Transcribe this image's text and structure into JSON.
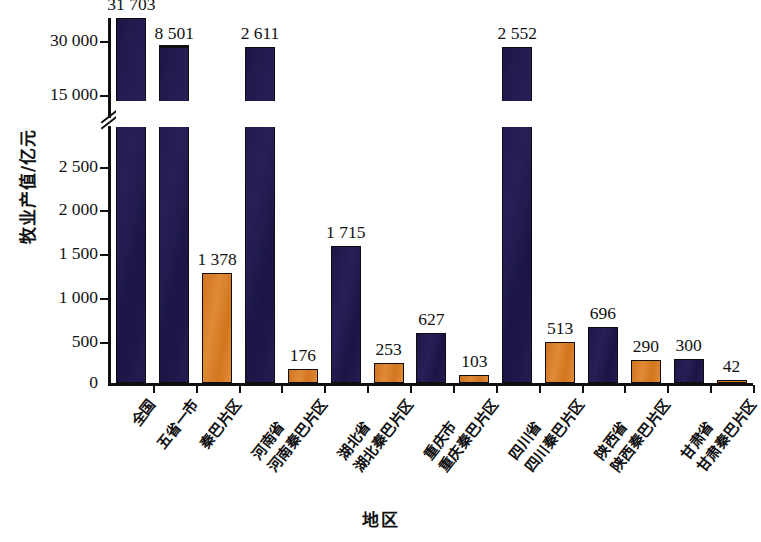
{
  "chart_data": {
    "type": "bar",
    "title": "",
    "xlabel": "地区",
    "ylabel": "牧业产值/亿元",
    "grid": false,
    "legend": null,
    "broken_axis": true,
    "axis_note": "y-axis is broken between 2 500 and 15 000",
    "ylim_lower": [
      0,
      2500
    ],
    "ylim_upper": [
      15000,
      30000
    ],
    "yticks_lower": [
      "0",
      "500",
      "1 000",
      "1 500",
      "2 000",
      "2 500"
    ],
    "yticks_upper": [
      "15 000",
      "30 000"
    ],
    "categories": [
      "全国",
      "五省一市",
      "秦巴片区",
      "河南省",
      "河南秦巴片区",
      "湖北省",
      "湖北秦巴片区",
      "重庆市",
      "重庆秦巴片区",
      "四川省",
      "四川秦巴片区",
      "陕西省",
      "陕西秦巴片区",
      "甘肃省",
      "甘肃秦巴片区"
    ],
    "values": [
      31703,
      8501,
      1378,
      2611,
      176,
      1715,
      253,
      627,
      103,
      2552,
      513,
      696,
      290,
      300,
      42
    ],
    "value_labels": [
      "31 703",
      "8 501",
      "1 378",
      "2 611",
      "176",
      "1 715",
      "253",
      "627",
      "103",
      "2 552",
      "513",
      "696",
      "290",
      "300",
      "42"
    ],
    "series_colors": {
      "region_total": "#1d1748",
      "qinba_area": "#d2761f"
    },
    "bar_colors": [
      "navy",
      "navy",
      "orange",
      "navy",
      "orange",
      "navy",
      "orange",
      "navy",
      "orange",
      "navy",
      "orange",
      "navy",
      "orange",
      "navy",
      "orange"
    ]
  },
  "colors": {
    "navy": "#1d1748",
    "orange": "#d2761f",
    "axis": "#101010",
    "background": "#ffffff"
  }
}
